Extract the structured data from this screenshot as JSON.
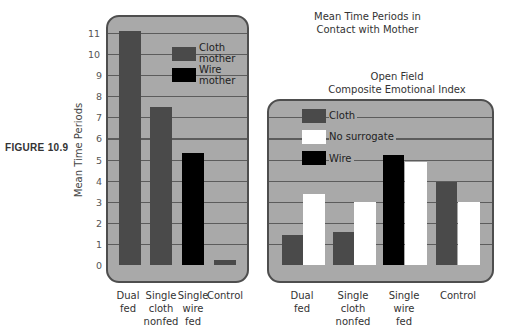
{
  "figure_label": "FIGURE 10.9",
  "colors": {
    "panel": "#a9a9a9",
    "border": "#4e4e4e",
    "cloth": "#4a4a4a",
    "wire": "#000000",
    "no_surrogate": "#ffffff",
    "grid": "#5c5c5c"
  },
  "chart_data": [
    {
      "type": "bar",
      "title": "Mean Time Periods in Contact with Mother",
      "title_lines": [
        "Mean Time Periods in",
        "Contact with Mother"
      ],
      "ylabel": "Mean Time Periods",
      "xlabel": "",
      "ylim": [
        0,
        11
      ],
      "yticks": [
        "0",
        "1",
        "2",
        "3",
        "4",
        "5",
        "6",
        "7",
        "8",
        "9",
        "10",
        "11"
      ],
      "grid": true,
      "legend_position": "upper right inside",
      "legend": [
        {
          "label_lines": [
            "Cloth",
            "mother"
          ],
          "color": "#4a4a4a"
        },
        {
          "label_lines": [
            "Wire",
            "mother"
          ],
          "color": "#000000"
        }
      ],
      "categories": [
        "Dual fed",
        "Single cloth nonfed",
        "Single wire fed",
        "Control"
      ],
      "category_lines": [
        [
          "Dual",
          "fed"
        ],
        [
          "Single",
          "cloth",
          "nonfed"
        ],
        [
          "Single",
          "wire",
          "fed"
        ],
        [
          "Control"
        ]
      ],
      "series": [
        {
          "name": "Contact mother",
          "values": [
            11.1,
            7.5,
            5.3,
            0.25
          ],
          "mother_type": [
            "Cloth",
            "Cloth",
            "Wire",
            "Cloth"
          ]
        }
      ]
    },
    {
      "type": "bar",
      "title": "Open Field Composite Emotional Index",
      "title_lines": [
        "Open Field",
        "Composite Emotional Index"
      ],
      "ylabel": "",
      "xlabel": "",
      "ylim": [
        0,
        7
      ],
      "grid": true,
      "legend_position": "upper left inside",
      "legend": [
        {
          "label": "Cloth",
          "color": "#4a4a4a"
        },
        {
          "label": "No surrogate",
          "color": "#ffffff"
        },
        {
          "label": "Wire",
          "color": "#000000"
        }
      ],
      "categories": [
        "Dual fed",
        "Single cloth nonfed",
        "Single wire fed",
        "Control"
      ],
      "category_lines": [
        [
          "Dual",
          "fed"
        ],
        [
          "Single",
          "cloth",
          "nonfed"
        ],
        [
          "Single",
          "wire",
          "fed"
        ],
        [
          "Control"
        ]
      ],
      "series": [
        {
          "name": "Mother surrogate (Cloth/Wire)",
          "values": [
            1.4,
            1.55,
            5.2,
            3.95
          ],
          "surrogate_type": [
            "Cloth",
            "Cloth",
            "Wire",
            "Cloth"
          ]
        },
        {
          "name": "No surrogate",
          "values": [
            3.35,
            3.0,
            4.9,
            3.0
          ]
        }
      ]
    }
  ]
}
